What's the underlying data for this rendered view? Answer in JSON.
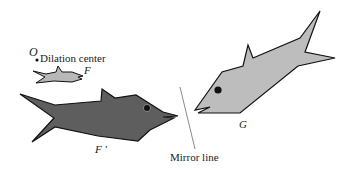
{
  "labels": {
    "origin": "O",
    "dilation_center": "Dilation center",
    "fish_small": "F",
    "fish_large": "F ′",
    "fish_reflected": "G",
    "mirror_line": "Mirror line"
  },
  "colors": {
    "fish_small_fill": "#b8b8b8",
    "fish_large_fill": "#5e5e5e",
    "fish_reflected_fill": "#bdbdbd",
    "outline": "#111111",
    "mirror_line": "#8a8a8a"
  }
}
